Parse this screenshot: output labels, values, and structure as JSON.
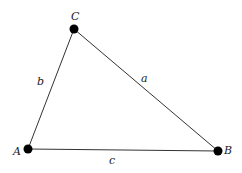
{
  "diagram": {
    "type": "triangle",
    "vertices": [
      {
        "label": "A",
        "x": 28,
        "y": 149,
        "lx": 13,
        "ly": 155
      },
      {
        "label": "B",
        "x": 218,
        "y": 151,
        "lx": 224,
        "ly": 154
      },
      {
        "label": "C",
        "x": 74,
        "y": 29,
        "lx": 71,
        "ly": 20
      }
    ],
    "sides": [
      {
        "label": "a",
        "lx": 141,
        "ly": 82
      },
      {
        "label": "b",
        "lx": 37,
        "ly": 85
      },
      {
        "label": "c",
        "lx": 109,
        "ly": 164
      }
    ],
    "colors": {
      "stroke": "#333333",
      "point": "#000000"
    }
  }
}
